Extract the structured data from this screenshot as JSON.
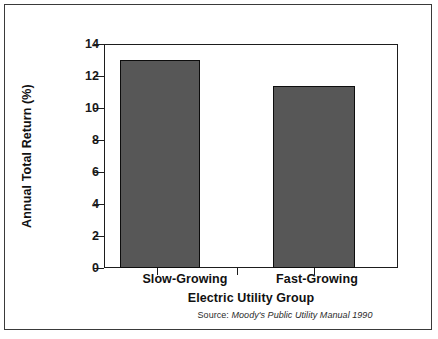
{
  "chart_data": {
    "type": "bar",
    "title": "",
    "subtitle": "",
    "categories": [
      "Slow-Growing",
      "Fast-Growing"
    ],
    "values": [
      13.0,
      11.4
    ],
    "series": [
      {
        "name": "Annual Total Return",
        "values": [
          13.0,
          11.4
        ]
      }
    ],
    "xlabel": "Electric Utility Group",
    "ylabel": "Annual Total Return (%)",
    "ylim": [
      0,
      14
    ],
    "xlim": [
      0,
      1
    ],
    "ytick_labels": [
      "0",
      "2",
      "4",
      "6",
      "8",
      "10",
      "12",
      "14"
    ],
    "ytick_values": [
      0,
      2,
      4,
      6,
      8,
      10,
      12,
      14
    ],
    "ytick_step": 2,
    "grid": false,
    "legend": false,
    "legend_position": "none",
    "annotations": [
      {
        "name": "source-note",
        "prefix": "Source: ",
        "reference": "Moody's Public Utility Manual 1990",
        "style": "italic-reference"
      }
    ],
    "colors": {
      "bar_fill": "#575757",
      "bar_edge": "#0d0d0d",
      "axis": "#1d1d1d",
      "text": "#111111",
      "background": "#ffffff",
      "outer_border": "#3a3a3a"
    },
    "bar_geometry": [
      {
        "category": "Slow-Growing",
        "left_pct": 5.4,
        "width_pct": 27.2
      },
      {
        "category": "Fast-Growing",
        "left_pct": 57.5,
        "width_pct": 27.9
      }
    ],
    "xtick_positions_pct": [
      18.0,
      45.2,
      71.4
    ]
  },
  "figure": {
    "y_axis_title": "Annual Total Return (%)",
    "x_axis_title": "Electric Utility Group",
    "source_prefix": "Source: ",
    "source_reference": "Moody's Public Utility Manual 1990"
  }
}
